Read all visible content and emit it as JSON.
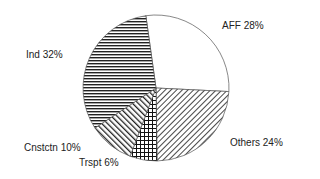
{
  "chart_data": {
    "type": "pie",
    "title": "",
    "start_angle_deg": -8,
    "direction": "clockwise",
    "center": [
      156,
      88
    ],
    "radius": 73,
    "slices": [
      {
        "label": "AFF",
        "value": 28,
        "display": "AFF 28%",
        "pattern": "none",
        "label_pos": [
          222,
          20
        ]
      },
      {
        "label": "Others",
        "value": 24,
        "display": "Others 24%",
        "pattern": "diag-right",
        "label_pos": [
          230,
          137
        ]
      },
      {
        "label": "Trspt",
        "value": 6,
        "display": "Trspt 6%",
        "pattern": "crosshatch",
        "label_pos": [
          79,
          157
        ]
      },
      {
        "label": "Cnstctn",
        "value": 10,
        "display": "Cnstctn 10%",
        "pattern": "diag-left",
        "label_pos": [
          24,
          142
        ]
      },
      {
        "label": "Ind",
        "value": 32,
        "display": "Ind 32%",
        "pattern": "horizontal",
        "label_pos": [
          26,
          49
        ]
      }
    ],
    "legend": "none (inline labels)"
  }
}
